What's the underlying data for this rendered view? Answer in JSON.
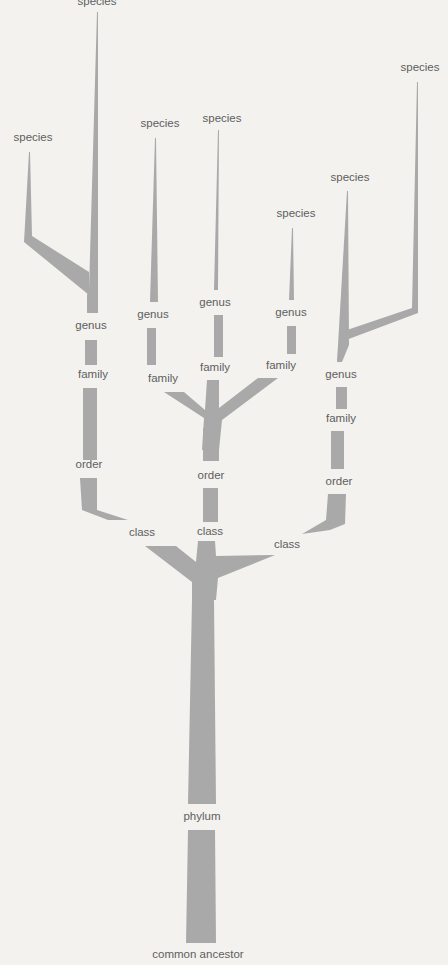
{
  "diagram": {
    "colors": {
      "background": "#f3f2ef",
      "branch": "#a9a9a9",
      "label": "#5e5e5e"
    },
    "labels": {
      "species_1": "species",
      "species_2": "species",
      "species_3": "species",
      "species_4": "species",
      "species_5": "species",
      "species_6": "species",
      "species_7": "species",
      "genus_1": "genus",
      "genus_2": "genus",
      "genus_3": "genus",
      "genus_4": "genus",
      "genus_5": "genus",
      "family_1": "family",
      "family_2": "family",
      "family_3": "family",
      "family_4": "family",
      "family_5": "family",
      "order_1": "order",
      "order_2": "order",
      "order_3": "order",
      "class_1": "class",
      "class_2": "class",
      "class_3": "class",
      "phylum": "phylum",
      "root": "common ancestor"
    }
  }
}
